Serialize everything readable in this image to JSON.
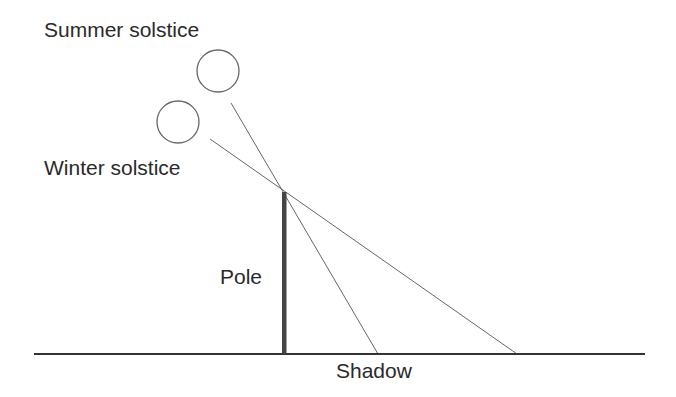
{
  "diagram": {
    "labels": {
      "summer": "Summer solstice",
      "winter": "Winter solstice",
      "pole": "Pole",
      "shadow": "Shadow"
    },
    "elements": {
      "summer_sun": {
        "shape": "circle",
        "cx": 218,
        "cy": 71,
        "r": 21
      },
      "winter_sun": {
        "shape": "circle",
        "cx": 178,
        "cy": 122,
        "r": 21
      },
      "pole": {
        "x": 284,
        "y_top": 192,
        "y_bottom": 354,
        "width": 4
      },
      "ground": {
        "x1": 34,
        "x2": 645,
        "y": 354
      },
      "summer_ray": {
        "x1": 231,
        "y1": 103,
        "x2": 378,
        "y2": 354
      },
      "winter_ray": {
        "x1": 210,
        "y1": 139,
        "x2": 517,
        "y2": 354
      }
    },
    "colors": {
      "stroke": "#555555",
      "pole": "#444444",
      "ground": "#333333",
      "text": "#2a2a2a"
    }
  }
}
